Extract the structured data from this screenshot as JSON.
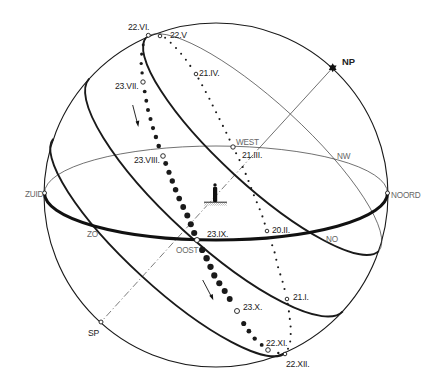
{
  "colors": {
    "ink": "#1a1a1a",
    "thin_line": "#333333",
    "compass_label": "#666666",
    "background": "#ffffff",
    "hatch": "#aaaaaa"
  },
  "compass": {
    "zuid": "ZUID",
    "noord": "NOORD",
    "west": "WEST",
    "oost": "OOST",
    "nw": "NW",
    "no": "NO",
    "zo": "ZO"
  },
  "poles": {
    "np": "NP",
    "sp": "SP"
  },
  "dates": {
    "jun22": "22.VI.",
    "may22": "22.V",
    "apr21": "21.IV.",
    "jul23": "23.VII.",
    "mar21": "21.III.",
    "aug23": "23.VIII.",
    "sep23": "23.IX.",
    "feb20": "20.II.",
    "jan21": "21.I.",
    "oct23": "23.X.",
    "nov22": "22.XI.",
    "dec22": "22.XII."
  },
  "markers": [
    {
      "name": "marker-22-vi",
      "x": 148.3,
      "y": 35.3,
      "r": 2.0
    },
    {
      "name": "marker-22-v",
      "x": 160,
      "y": 36,
      "r": 1.8
    },
    {
      "name": "marker-21-iv",
      "x": 196,
      "y": 74,
      "r": 1.8
    },
    {
      "name": "marker-23-vii",
      "x": 143,
      "y": 82,
      "r": 2.2
    },
    {
      "name": "marker-23-viii",
      "x": 163,
      "y": 156,
      "r": 2.3
    },
    {
      "name": "marker-west",
      "x": 233,
      "y": 147,
      "r": 2.2
    },
    {
      "name": "marker-20-ii",
      "x": 267,
      "y": 231,
      "r": 1.8
    },
    {
      "name": "marker-oost",
      "x": 197,
      "y": 240,
      "r": 2.5
    },
    {
      "name": "marker-21-i",
      "x": 287,
      "y": 299,
      "r": 1.8
    },
    {
      "name": "marker-23-x",
      "x": 237,
      "y": 311,
      "r": 2.5
    },
    {
      "name": "marker-22-xi",
      "x": 268,
      "y": 350,
      "r": 2.3
    },
    {
      "name": "marker-22-xii",
      "x": 285,
      "y": 354,
      "r": 1.8
    },
    {
      "name": "marker-zuid",
      "x": 44.5,
      "y": 193,
      "r": 2.0
    },
    {
      "name": "marker-noord",
      "x": 387.5,
      "y": 193,
      "r": 2.0
    },
    {
      "name": "marker-sp",
      "x": 101,
      "y": 322,
      "r": 2.0
    }
  ],
  "ecliptic": {
    "second_half_large_dots": {
      "spacing": 9.4,
      "points": [
        [
          146,
          38,
          1.4
        ],
        [
          142,
          48,
          1.5
        ],
        [
          141,
          62,
          1.6
        ],
        [
          143,
          82,
          1.8
        ],
        [
          148,
          110,
          2.0
        ],
        [
          153,
          128,
          2.1
        ],
        [
          159,
          147,
          2.3
        ],
        [
          163,
          156,
          2.4
        ],
        [
          170,
          175,
          2.6
        ],
        [
          178,
          196,
          2.8
        ],
        [
          188,
          217,
          3.0
        ],
        [
          197,
          240,
          3.1
        ],
        [
          207,
          259,
          3.2
        ],
        [
          215,
          277,
          3.1
        ],
        [
          226,
          293,
          3.0
        ],
        [
          237,
          311,
          2.8
        ],
        [
          245,
          326,
          2.5
        ],
        [
          254,
          338,
          2.2
        ],
        [
          263,
          346,
          1.9
        ],
        [
          268,
          350,
          1.6
        ],
        [
          278,
          353,
          1.2
        ],
        [
          285,
          354,
          1.0
        ]
      ]
    },
    "first_half_small_dots": {
      "spacing": 7.6,
      "points": [
        [
          285,
          354,
          1.0
        ],
        [
          290,
          345,
          1.0
        ],
        [
          291,
          330,
          1.05
        ],
        [
          289,
          312,
          1.05
        ],
        [
          287,
          299,
          1.05
        ],
        [
          283,
          283,
          1.05
        ],
        [
          278,
          267,
          1.05
        ],
        [
          274,
          250,
          1.05
        ],
        [
          267,
          231,
          1.05
        ],
        [
          262,
          215,
          1.05
        ],
        [
          255,
          198,
          1.05
        ],
        [
          245,
          172,
          1.05
        ],
        [
          238,
          157,
          1.05
        ],
        [
          233,
          147,
          1.05
        ],
        [
          225,
          130,
          1.05
        ],
        [
          217,
          114,
          1.05
        ],
        [
          208,
          96,
          1.05
        ],
        [
          196,
          74,
          1.05
        ],
        [
          184,
          57,
          1.0
        ],
        [
          175,
          47,
          1.0
        ],
        [
          166,
          38,
          1.0
        ],
        [
          160,
          36,
          1.0
        ],
        [
          154,
          34,
          1.0
        ],
        [
          148,
          35,
          1.0
        ]
      ]
    }
  }
}
